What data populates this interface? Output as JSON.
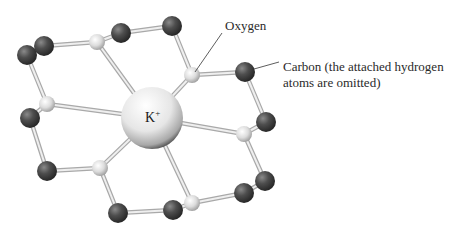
{
  "diagram": {
    "labels": {
      "oxygen": "Oxygen",
      "carbon_line1": "Carbon (the attached hydrogen",
      "carbon_line2": "atoms are omitted)",
      "cation": "K",
      "cation_charge": "+"
    },
    "colors": {
      "background": "#ffffff",
      "carbon": "#4a4a4a",
      "oxygen": "#d8d8d8",
      "potassium": "#eeeeee",
      "bond": "#d0d0d0",
      "leader_line": "#333333",
      "text": "#2a2a2a"
    },
    "atoms": [
      {
        "id": "C1",
        "element": "C",
        "x": 27,
        "y": 55,
        "r": 10
      },
      {
        "id": "C2",
        "element": "C",
        "x": 44,
        "y": 46,
        "r": 10
      },
      {
        "id": "O1",
        "element": "O",
        "x": 97,
        "y": 42,
        "r": 8
      },
      {
        "id": "C3",
        "element": "C",
        "x": 121,
        "y": 33,
        "r": 10
      },
      {
        "id": "C4",
        "element": "C",
        "x": 172,
        "y": 26,
        "r": 10
      },
      {
        "id": "O2",
        "element": "O",
        "x": 192,
        "y": 75,
        "r": 8
      },
      {
        "id": "C5",
        "element": "C",
        "x": 245,
        "y": 72,
        "r": 10
      },
      {
        "id": "C6",
        "element": "C",
        "x": 266,
        "y": 122,
        "r": 10
      },
      {
        "id": "O3",
        "element": "O",
        "x": 244,
        "y": 134,
        "r": 8
      },
      {
        "id": "C7",
        "element": "C",
        "x": 265,
        "y": 181,
        "r": 10
      },
      {
        "id": "C8",
        "element": "C",
        "x": 244,
        "y": 193,
        "r": 10
      },
      {
        "id": "O4",
        "element": "O",
        "x": 192,
        "y": 203,
        "r": 8
      },
      {
        "id": "C9",
        "element": "C",
        "x": 173,
        "y": 210,
        "r": 10
      },
      {
        "id": "C10",
        "element": "C",
        "x": 118,
        "y": 213,
        "r": 10
      },
      {
        "id": "O5",
        "element": "O",
        "x": 100,
        "y": 168,
        "r": 8
      },
      {
        "id": "C11",
        "element": "C",
        "x": 47,
        "y": 171,
        "r": 10
      },
      {
        "id": "C12",
        "element": "C",
        "x": 30,
        "y": 118,
        "r": 10
      },
      {
        "id": "O6",
        "element": "O",
        "x": 47,
        "y": 104,
        "r": 8
      }
    ],
    "cation": {
      "element": "K+",
      "x": 152,
      "y": 118,
      "r": 31
    },
    "ring_bonds": [
      [
        "C1",
        "C2"
      ],
      [
        "C2",
        "O1"
      ],
      [
        "O1",
        "C3"
      ],
      [
        "C3",
        "C4"
      ],
      [
        "C4",
        "O2"
      ],
      [
        "O2",
        "C5"
      ],
      [
        "C5",
        "C6"
      ],
      [
        "C6",
        "O3"
      ],
      [
        "O3",
        "C7"
      ],
      [
        "C7",
        "C8"
      ],
      [
        "C8",
        "O4"
      ],
      [
        "O4",
        "C9"
      ],
      [
        "C9",
        "C10"
      ],
      [
        "C10",
        "O5"
      ],
      [
        "O5",
        "C11"
      ],
      [
        "C11",
        "C12"
      ],
      [
        "C12",
        "O6"
      ],
      [
        "O6",
        "C1"
      ]
    ],
    "coordination_bonds": [
      "O1",
      "O2",
      "O3",
      "O4",
      "O5",
      "O6"
    ],
    "annotations": [
      {
        "label": "oxygen",
        "text_x": 225,
        "text_y": 30,
        "line": [
          222,
          33,
          195,
          72
        ]
      },
      {
        "label": "carbon",
        "text_x": 283,
        "text_y": 71,
        "line2_y": 87,
        "line": [
          254,
          69,
          279,
          62
        ]
      }
    ]
  }
}
